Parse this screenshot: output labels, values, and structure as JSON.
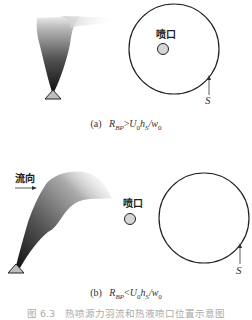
{
  "panel_a": {
    "nozzle_label": "喷口",
    "arrow_label": "S",
    "caption_prefix": "(a)",
    "caption_formula": "R_BP > U_0 h_S / w_0",
    "caption_lhs": "R",
    "caption_lhs_sub": "BP",
    "caption_op": ">",
    "caption_rhs": "U",
    "caption_rhs_sub1": "0",
    "caption_rhs_mid": "h",
    "caption_rhs_sub2": "S",
    "caption_rhs_div": "/w",
    "caption_rhs_sub3": "0"
  },
  "panel_b": {
    "flow_label": "流向",
    "nozzle_label": "喷口",
    "arrow_label": "S",
    "caption_prefix": "(b)",
    "caption_formula": "R_BP < U_0 h_S / w_0",
    "caption_lhs": "R",
    "caption_lhs_sub": "BP",
    "caption_op": "<",
    "caption_rhs": "U",
    "caption_rhs_sub1": "0",
    "caption_rhs_mid": "h",
    "caption_rhs_sub2": "S",
    "caption_rhs_div": "/w",
    "caption_rhs_sub3": "0"
  },
  "figure_caption": "图 6.3　热喷源力羽流和热液喷口位置示意图",
  "colors": {
    "line": "#222222",
    "nozzle_fill": "#d6d6d6",
    "source_fill": "#bdbdbd",
    "plume_dark": "#111111",
    "caption_faded": "#aaaaaa"
  }
}
